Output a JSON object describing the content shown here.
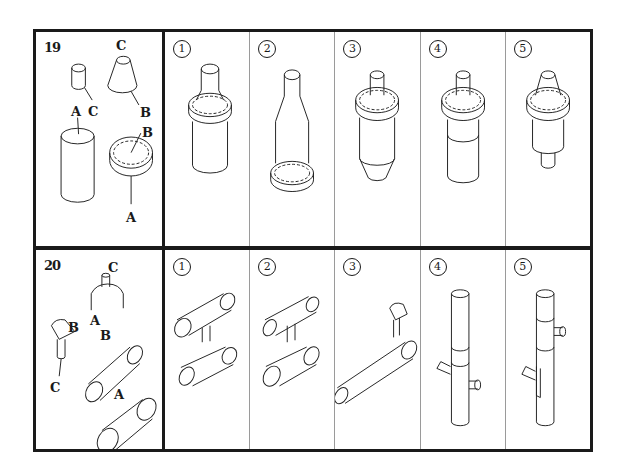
{
  "questions": [
    {
      "number": "19",
      "key_labels": [
        "C",
        "C",
        "B",
        "A",
        "B",
        "A"
      ],
      "options": [
        {
          "label": "1"
        },
        {
          "label": "2"
        },
        {
          "label": "3"
        },
        {
          "label": "4"
        },
        {
          "label": "5"
        }
      ]
    },
    {
      "number": "20",
      "key_labels": [
        "C",
        "A",
        "B",
        "B",
        "C",
        "A"
      ],
      "options": [
        {
          "label": "1"
        },
        {
          "label": "2"
        },
        {
          "label": "3"
        },
        {
          "label": "4"
        },
        {
          "label": "5"
        }
      ]
    }
  ]
}
